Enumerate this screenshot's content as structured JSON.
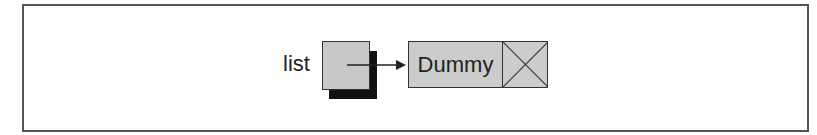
{
  "diagram": {
    "type": "linked-list",
    "pointer": {
      "label": "list"
    },
    "nodes": [
      {
        "data": "Dummy",
        "next": "null"
      }
    ],
    "colors": {
      "frame": "#555555",
      "box_fill": "#c8c8c8",
      "shadow": "#111111",
      "stroke": "#333333"
    }
  }
}
